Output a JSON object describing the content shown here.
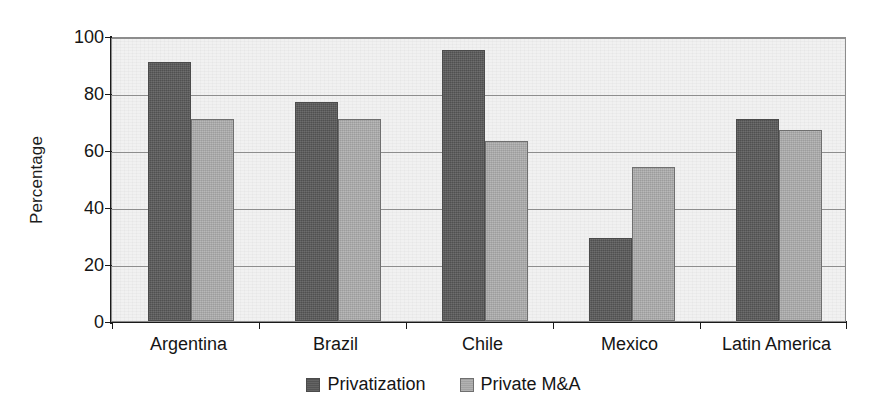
{
  "chart_data": {
    "type": "bar",
    "title": "",
    "subtitle": "",
    "xlabel": "",
    "ylabel": "Percentage",
    "categories": [
      "Argentina",
      "Brazil",
      "Chile",
      "Mexico",
      "Latin America"
    ],
    "series": [
      {
        "name": "Privatization",
        "color": "#585858",
        "values": [
          91,
          77,
          95,
          29,
          71
        ]
      },
      {
        "name": "Private M&A",
        "color": "#a9a9a9",
        "values": [
          71,
          71,
          63,
          54,
          67
        ]
      }
    ],
    "ylim": [
      0,
      100
    ],
    "yticks": [
      0,
      20,
      40,
      60,
      80,
      100
    ],
    "ytick_labels": [
      "0",
      "20",
      "40",
      "60",
      "80",
      "100"
    ],
    "grid": "horizontal",
    "legend_position": "bottom-center",
    "bar_orientation": "vertical",
    "annotations": []
  },
  "style": {
    "plot_background": "#f1f1f1",
    "gridline_color": "#8d8d8d",
    "axis_color": "#1a1a1a",
    "frame_color": "#8c8c8c",
    "text_color": "#151515"
  }
}
